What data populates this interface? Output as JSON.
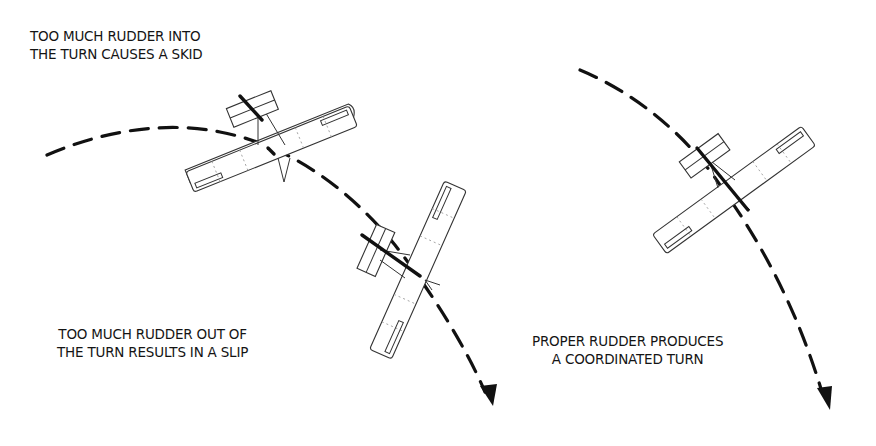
{
  "diagram": {
    "captions": {
      "skid": {
        "line1": "TOO MUCH RUDDER INTO",
        "line2": "THE TURN CAUSES A SKID"
      },
      "slip": {
        "line1": "TOO MUCH RUDDER OUT OF",
        "line2": "THE TURN RESULTS IN A SLIP"
      },
      "coordinated": {
        "line1": "PROPER RUDDER PRODUCES",
        "line2": "A COORDINATED TURN"
      }
    },
    "aircraft": [
      {
        "id": "skid-aircraft",
        "condition": "skid",
        "icon": "airplane-icon"
      },
      {
        "id": "slip-aircraft",
        "condition": "slip",
        "icon": "airplane-icon"
      },
      {
        "id": "coordinated-aircraft",
        "condition": "coordinated",
        "icon": "airplane-icon"
      }
    ],
    "flight_paths": [
      {
        "id": "left-turn-path",
        "style": "dashed",
        "end": "arrowhead"
      },
      {
        "id": "right-turn-path",
        "style": "dashed",
        "end": "arrowhead"
      }
    ],
    "colors": {
      "ink": "#111111",
      "background": "#ffffff"
    }
  }
}
